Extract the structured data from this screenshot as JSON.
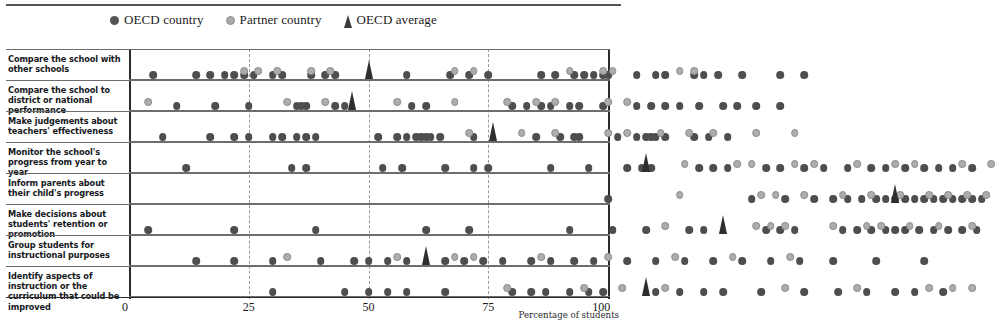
{
  "legend": {
    "items": [
      {
        "label": "OECD country",
        "marker": "filled-dark-circle",
        "color": "#545454"
      },
      {
        "label": "Partner country",
        "marker": "filled-grey-circle",
        "color": "#a9a9a9"
      },
      {
        "label": "OECD average",
        "marker": "triangle",
        "color": "#3a3a3a"
      }
    ]
  },
  "axis": {
    "caption": "Percentage of students",
    "ticks": [
      "0",
      "25",
      "50",
      "75",
      "100"
    ],
    "min": 0,
    "max": 100
  },
  "chart_data": {
    "type": "scatter",
    "title": "",
    "xlabel": "Percentage of students",
    "ylabel": "",
    "xlim": [
      0,
      100
    ],
    "grid": true,
    "legend_position": "top",
    "series_definitions": [
      {
        "name": "OECD country",
        "key": "oecd",
        "color": "#4e4e4e"
      },
      {
        "name": "Partner country",
        "key": "partner",
        "color": "#adadad"
      },
      {
        "name": "OECD average",
        "key": "average",
        "color": "#2e2e2e"
      }
    ],
    "categories": [
      "Compare the school with other schools",
      "Compare the school to district or national performance",
      "Make judgements about teachers' effectiveness",
      "Monitor the school's progress from year to year",
      "Inform parents about their child's progress",
      "Make decisions about students' retention or promotion",
      "Group students for instructional purposes",
      "Identify aspects of instruction or the curriculum that could be improved"
    ],
    "rows": [
      {
        "category": "Compare the school with other schools",
        "oecd": [
          5,
          14,
          17,
          20,
          22,
          24,
          26,
          30,
          32,
          38,
          41,
          43,
          58,
          67,
          71,
          75,
          86,
          89,
          93,
          95,
          97,
          99,
          100,
          106,
          110,
          112,
          118,
          120,
          123,
          128,
          136,
          141
        ],
        "partner": [
          24,
          27,
          31,
          38,
          42,
          68,
          72,
          92,
          99,
          101,
          115,
          118
        ],
        "average": 50.2
      },
      {
        "category": "Compare the school to district or national performance",
        "oecd": [
          10,
          18,
          25,
          35,
          36,
          37,
          43,
          45,
          59,
          62,
          80,
          83,
          86,
          88,
          92,
          94,
          99,
          106,
          109,
          112,
          115,
          119,
          124,
          127,
          131,
          136
        ],
        "partner": [
          4,
          33,
          41,
          56,
          68,
          79,
          85,
          89,
          100,
          104
        ],
        "average": 46.5
      },
      {
        "category": "Make judgements about teachers' effectiveness",
        "oecd": [
          7,
          17,
          22,
          25,
          30,
          32,
          35,
          37,
          39,
          52,
          56,
          58,
          60,
          61,
          62,
          63,
          65,
          72,
          85,
          90,
          93,
          94,
          102,
          106,
          108,
          109,
          110,
          112,
          118,
          121,
          125
        ],
        "partner": [
          71,
          82,
          89,
          100,
          104,
          111,
          117,
          122,
          131,
          139
        ],
        "average": 76.0
      },
      {
        "category": "Monitor the school's progress from year to year",
        "oecd": [
          12,
          34,
          37,
          53,
          57,
          66,
          72,
          75,
          88,
          96,
          104,
          107,
          109,
          119,
          122,
          125,
          133,
          136,
          141,
          145,
          150,
          155,
          158,
          162,
          166,
          169,
          172,
          176
        ],
        "partner": [
          116,
          127,
          130,
          139,
          143,
          152,
          160,
          164,
          174,
          180
        ],
        "average": 108.0
      },
      {
        "category": "Inform parents about their child's progress",
        "oecd": [
          100,
          130,
          137,
          143,
          147,
          150,
          153,
          156,
          158,
          160,
          162,
          164,
          166,
          168,
          170,
          172,
          174,
          176,
          178
        ],
        "partner": [
          115,
          132,
          135,
          141,
          149,
          155,
          161,
          167,
          171,
          175,
          179
        ],
        "average": 160.0
      },
      {
        "category": "Make decisions about students' retention or promotion",
        "oecd": [
          4,
          22,
          39,
          62,
          71,
          92,
          101,
          108,
          117,
          120,
          133,
          136,
          139,
          149,
          152,
          155,
          158,
          160,
          162,
          165,
          168,
          171,
          174,
          177
        ],
        "partner": [
          112,
          131,
          134,
          137,
          147,
          154,
          157,
          163,
          169,
          176
        ],
        "average": 124.0
      },
      {
        "category": "Group students for instructional purposes",
        "oecd": [
          14,
          22,
          30,
          40,
          47,
          50,
          54,
          58,
          66,
          70,
          74,
          78,
          84,
          88,
          93,
          97,
          104,
          110,
          116,
          122,
          128,
          134,
          140,
          147,
          156,
          166
        ],
        "partner": [
          33,
          56,
          68,
          72,
          86,
          100,
          114,
          126,
          138
        ],
        "average": 62.0
      },
      {
        "category": "Identify aspects of instruction or the curriculum that could be improved",
        "oecd": [
          30,
          45,
          50,
          54,
          58,
          66,
          80,
          84,
          87,
          92,
          96,
          99,
          110,
          115,
          120,
          124,
          132,
          141,
          148,
          154,
          160,
          164,
          170
        ],
        "partner": [
          79,
          95,
          103,
          112,
          137,
          152,
          167,
          172,
          176
        ],
        "average": 108.0
      }
    ]
  }
}
